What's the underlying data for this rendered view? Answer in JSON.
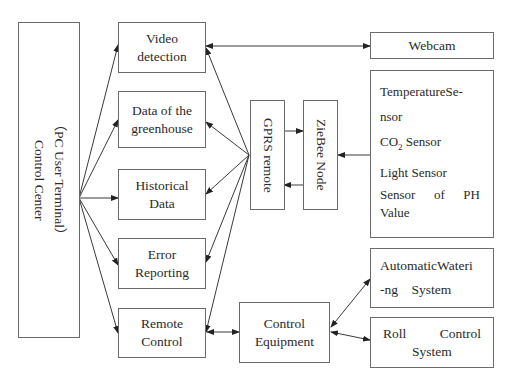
{
  "control_center": {
    "title": "Control Center",
    "subtitle": "（PC User Terminal）"
  },
  "modules": [
    {
      "id": "video",
      "lines": [
        "Video",
        "detection"
      ]
    },
    {
      "id": "greenhouse",
      "lines": [
        "Data of the",
        "greenhouse"
      ]
    },
    {
      "id": "historical",
      "lines": [
        "Historical",
        "Data"
      ]
    },
    {
      "id": "error",
      "lines": [
        "Error",
        "Reporting"
      ]
    },
    {
      "id": "remote",
      "lines": [
        "Remote",
        "Control"
      ]
    }
  ],
  "gprs": {
    "label": "GPRS remote"
  },
  "zigbee": {
    "label": "ZieBee Node"
  },
  "webcam": {
    "label": "Webcam"
  },
  "sensors": {
    "line1": "TemperatureSe-",
    "line2": "nsor",
    "co2_prefix": "CO",
    "co2_sub": "2",
    "co2_suffix": " Sensor",
    "light": "Light Sensor",
    "ph_words": [
      "Sensor",
      "of",
      "PH"
    ],
    "ph_line2": "Value"
  },
  "control_equipment": {
    "lines": [
      "Control",
      "Equipment"
    ]
  },
  "watering": {
    "line1": "AutomaticWateri",
    "line2": "-ng    System"
  },
  "roll": {
    "words": [
      "Roll",
      "Control"
    ],
    "line2": "System"
  },
  "colors": {
    "line": "#3a3a3a",
    "border": "#6a6a6a"
  }
}
